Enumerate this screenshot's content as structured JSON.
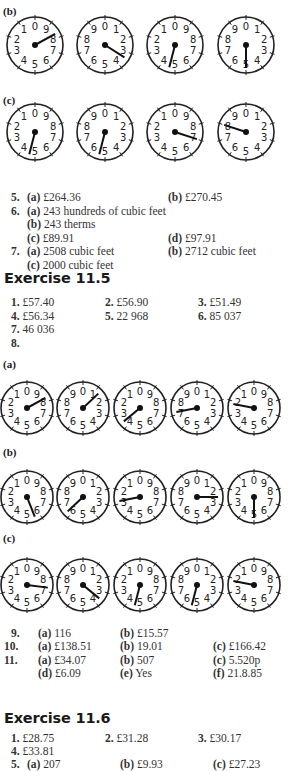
{
  "section_4_dials": {
    "b": {
      "label": "(b)",
      "dials": [
        {
          "digits": [
            "0",
            "9",
            "8",
            "7",
            "6",
            "5",
            "4",
            "3",
            "2",
            "1"
          ],
          "hand_to": 8.3
        },
        {
          "digits": [
            "0",
            "1",
            "2",
            "3",
            "4",
            "5",
            "6",
            "7",
            "8",
            "9"
          ],
          "hand_to": 3.4
        },
        {
          "digits": [
            "0",
            "9",
            "8",
            "7",
            "6",
            "5",
            "4",
            "3",
            "2",
            "1"
          ],
          "hand_to": 4.6
        },
        {
          "digits": [
            "0",
            "1",
            "2",
            "3",
            "4",
            "5",
            "6",
            "7",
            "8",
            "9"
          ],
          "hand_to": 5.0
        }
      ]
    },
    "c": {
      "label": "(c)",
      "dials": [
        {
          "digits": [
            "0",
            "9",
            "8",
            "7",
            "6",
            "5",
            "4",
            "3",
            "2",
            "1"
          ],
          "hand_to": 4.6
        },
        {
          "digits": [
            "0",
            "1",
            "2",
            "3",
            "4",
            "5",
            "6",
            "7",
            "8",
            "9"
          ],
          "hand_to": 5.4
        },
        {
          "digits": [
            "0",
            "9",
            "8",
            "7",
            "6",
            "5",
            "4",
            "3",
            "2",
            "1"
          ],
          "hand_to": 7.0
        },
        {
          "digits": [
            "0",
            "1",
            "2",
            "3",
            "4",
            "5",
            "6",
            "7",
            "8",
            "9"
          ],
          "hand_to": 8.0
        }
      ]
    }
  },
  "answers_part1": [
    {
      "num": "5.",
      "items": [
        {
          "tag": "(a)",
          "text": "£264.36"
        },
        {
          "tag": "(b)",
          "text": "£270.45"
        }
      ]
    },
    {
      "num": "6.",
      "items": [
        {
          "tag": "(a)",
          "text": "243 hundreds of cubic feet"
        }
      ]
    },
    {
      "num": "",
      "items": [
        {
          "tag": "(b)",
          "text": "243 therms"
        }
      ]
    },
    {
      "num": "",
      "items": [
        {
          "tag": "(c)",
          "text": "£89.91"
        },
        {
          "tag": "(d)",
          "text": "£97.91"
        }
      ]
    },
    {
      "num": "7.",
      "items": [
        {
          "tag": "(a)",
          "text": "2508 cubic feet"
        },
        {
          "tag": "(b)",
          "text": "2712 cubic feet"
        }
      ]
    },
    {
      "num": "",
      "items": [
        {
          "tag": "(c)",
          "text": "2000 cubic feet"
        }
      ]
    }
  ],
  "exercise_11_5": {
    "title": "Exercise 11.5",
    "rows": [
      [
        {
          "num": "1.",
          "text": "£57.40"
        },
        {
          "num": "2.",
          "text": "£56.90"
        },
        {
          "num": "3.",
          "text": "£51.49"
        }
      ],
      [
        {
          "num": "4.",
          "text": "£56.34"
        },
        {
          "num": "5.",
          "text": "22 968"
        },
        {
          "num": "6.",
          "text": "85 037"
        }
      ],
      [
        {
          "num": "7.",
          "text": "46 036"
        }
      ],
      [
        {
          "num": "8.",
          "text": ""
        }
      ]
    ],
    "dials": {
      "a": {
        "label": "(a)",
        "dials": [
          {
            "digits": [
              "0",
              "9",
              "8",
              "7",
              "6",
              "5",
              "4",
              "3",
              "2",
              "1"
            ],
            "hand_to": 8.3
          },
          {
            "digits": [
              "0",
              "1",
              "2",
              "3",
              "4",
              "5",
              "6",
              "7",
              "8",
              "9"
            ],
            "hand_to": 1.3
          },
          {
            "digits": [
              "0",
              "9",
              "8",
              "7",
              "6",
              "5",
              "4",
              "3",
              "2",
              "1"
            ],
            "hand_to": 3.6
          },
          {
            "digits": [
              "0",
              "1",
              "2",
              "3",
              "4",
              "5",
              "6",
              "7",
              "8",
              "9"
            ],
            "hand_to": 7.2
          },
          {
            "digits": [
              "0",
              "9",
              "8",
              "7",
              "6",
              "5",
              "4",
              "3",
              "2",
              "1"
            ],
            "hand_to": 2.2
          }
        ]
      },
      "b": {
        "label": "(b)",
        "dials": [
          {
            "digits": [
              "0",
              "9",
              "8",
              "7",
              "6",
              "5",
              "4",
              "3",
              "2",
              "1"
            ],
            "hand_to": 5.6
          },
          {
            "digits": [
              "0",
              "1",
              "2",
              "3",
              "4",
              "5",
              "6",
              "7",
              "8",
              "9"
            ],
            "hand_to": 6.3
          },
          {
            "digits": [
              "0",
              "9",
              "8",
              "7",
              "6",
              "5",
              "4",
              "3",
              "2",
              "1"
            ],
            "hand_to": 2.8
          },
          {
            "digits": [
              "0",
              "1",
              "2",
              "3",
              "4",
              "5",
              "6",
              "7",
              "8",
              "9"
            ],
            "hand_to": 2.5
          },
          {
            "digits": [
              "0",
              "9",
              "8",
              "7",
              "6",
              "5",
              "4",
              "3",
              "2",
              "1"
            ],
            "hand_to": 5.0
          }
        ]
      },
      "c": {
        "label": "(c)",
        "dials": [
          {
            "digits": [
              "0",
              "9",
              "8",
              "7",
              "6",
              "5",
              "4",
              "3",
              "2",
              "1"
            ],
            "hand_to": 7.3
          },
          {
            "digits": [
              "0",
              "1",
              "2",
              "3",
              "4",
              "5",
              "6",
              "7",
              "8",
              "9"
            ],
            "hand_to": 3.6
          },
          {
            "digits": [
              "0",
              "9",
              "8",
              "7",
              "6",
              "5",
              "4",
              "3",
              "2",
              "1"
            ],
            "hand_to": 4.6
          },
          {
            "digits": [
              "0",
              "1",
              "2",
              "3",
              "4",
              "5",
              "6",
              "7",
              "8",
              "9"
            ],
            "hand_to": 5.4
          },
          {
            "digits": [
              "0",
              "9",
              "8",
              "7",
              "6",
              "5",
              "4",
              "3",
              "2",
              "1"
            ],
            "hand_to": 2.2
          }
        ]
      }
    },
    "answers": [
      {
        "num": "9.",
        "items": [
          {
            "tag": "(a)",
            "text": "116"
          },
          {
            "tag": "(b)",
            "text": "£15.57"
          }
        ]
      },
      {
        "num": "10.",
        "items": [
          {
            "tag": "(a)",
            "text": "£138.51"
          },
          {
            "tag": "(b)",
            "text": "19.01"
          },
          {
            "tag": "(c)",
            "text": "£166.42"
          }
        ]
      },
      {
        "num": "11.",
        "items": [
          {
            "tag": "(a)",
            "text": "£34.07"
          },
          {
            "tag": "(b)",
            "text": "507"
          },
          {
            "tag": "(c)",
            "text": "5.520p"
          }
        ]
      },
      {
        "num": "",
        "items": [
          {
            "tag": "(d)",
            "text": "£6.09"
          },
          {
            "tag": "(e)",
            "text": "Yes"
          },
          {
            "tag": "(f)",
            "text": "21.8.85"
          }
        ]
      }
    ]
  },
  "exercise_11_6": {
    "title": "Exercise 11.6",
    "rows": [
      [
        {
          "num": "1.",
          "text": "£28.75"
        },
        {
          "num": "2.",
          "text": "£31.28"
        },
        {
          "num": "3.",
          "text": "£30.17"
        }
      ],
      [
        {
          "num": "4.",
          "text": "£33.81"
        }
      ]
    ],
    "answers": [
      {
        "num": "5.",
        "items": [
          {
            "tag": "(a)",
            "text": "207"
          },
          {
            "tag": "(b)",
            "text": "£9.93"
          },
          {
            "tag": "(c)",
            "text": "£27.23"
          }
        ]
      }
    ]
  }
}
